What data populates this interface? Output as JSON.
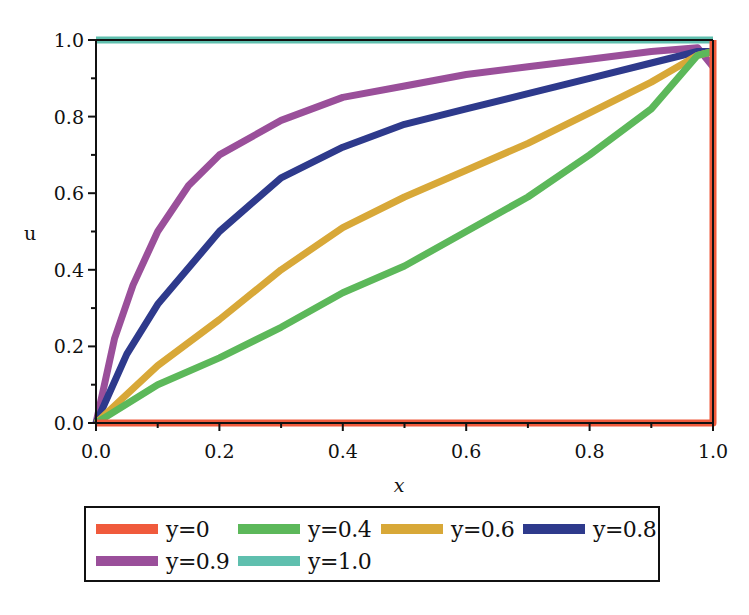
{
  "chart_data": {
    "type": "line",
    "title": "",
    "xlabel": "x",
    "ylabel": "u",
    "xlim": [
      0.0,
      1.0
    ],
    "ylim": [
      0.0,
      1.0
    ],
    "x_ticks": [
      "0.0",
      "0.2",
      "0.4",
      "0.6",
      "0.8",
      "1.0"
    ],
    "y_ticks": [
      "0.0",
      "0.2",
      "0.4",
      "0.6",
      "0.8",
      "1.0"
    ],
    "grid": false,
    "legend_position": "bottom",
    "series": [
      {
        "name": "y=0",
        "color": "#f05a3c",
        "x": [
          0.0,
          0.2,
          0.4,
          0.6,
          0.8,
          1.0,
          1.0
        ],
        "y": [
          0.0,
          0.0,
          0.0,
          0.0,
          0.0,
          0.0,
          1.0
        ]
      },
      {
        "name": "y=0.4",
        "color": "#5cb85a",
        "x": [
          0.0,
          0.1,
          0.2,
          0.3,
          0.4,
          0.5,
          0.6,
          0.7,
          0.8,
          0.9,
          0.975,
          1.0
        ],
        "y": [
          0.0,
          0.1,
          0.17,
          0.25,
          0.34,
          0.41,
          0.5,
          0.59,
          0.7,
          0.82,
          0.96,
          0.97
        ]
      },
      {
        "name": "y=0.6",
        "color": "#d8a838",
        "x": [
          0.0,
          0.1,
          0.2,
          0.3,
          0.4,
          0.5,
          0.6,
          0.7,
          0.8,
          0.9,
          0.975,
          1.0
        ],
        "y": [
          0.0,
          0.15,
          0.27,
          0.4,
          0.51,
          0.59,
          0.66,
          0.73,
          0.81,
          0.89,
          0.96,
          0.97
        ]
      },
      {
        "name": "y=0.8",
        "color": "#2e3a8c",
        "x": [
          0.0,
          0.05,
          0.1,
          0.2,
          0.3,
          0.4,
          0.5,
          0.6,
          0.7,
          0.8,
          0.9,
          0.975,
          1.0
        ],
        "y": [
          0.0,
          0.18,
          0.31,
          0.5,
          0.64,
          0.72,
          0.78,
          0.82,
          0.86,
          0.9,
          0.94,
          0.97,
          0.97
        ]
      },
      {
        "name": "y=0.9",
        "color": "#9a4f9a",
        "x": [
          0.0,
          0.03,
          0.06,
          0.1,
          0.15,
          0.2,
          0.3,
          0.4,
          0.5,
          0.6,
          0.7,
          0.8,
          0.9,
          0.975,
          1.0
        ],
        "y": [
          0.0,
          0.22,
          0.36,
          0.5,
          0.62,
          0.7,
          0.79,
          0.85,
          0.88,
          0.91,
          0.93,
          0.95,
          0.97,
          0.98,
          0.93
        ]
      },
      {
        "name": "y=1.0",
        "color": "#5fbfae",
        "x": [
          0.0,
          0.2,
          0.4,
          0.6,
          0.8,
          1.0
        ],
        "y": [
          1.0,
          1.0,
          1.0,
          1.0,
          1.0,
          1.0
        ]
      }
    ]
  },
  "legend": {
    "items": [
      {
        "label": "y=0",
        "color": "#f05a3c"
      },
      {
        "label": "y=0.4",
        "color": "#5cb85a"
      },
      {
        "label": "y=0.6",
        "color": "#d8a838"
      },
      {
        "label": "y=0.8",
        "color": "#2e3a8c"
      },
      {
        "label": "y=0.9",
        "color": "#9a4f9a"
      },
      {
        "label": "y=1.0",
        "color": "#5fbfae"
      }
    ]
  },
  "axes": {
    "x_label": "x",
    "y_label": "u"
  }
}
